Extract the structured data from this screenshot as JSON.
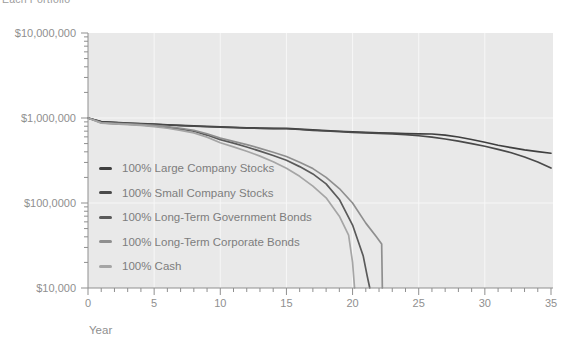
{
  "caption_top": "Each Portfolio",
  "colors": {
    "page_bg": "#ffffff",
    "plot_bg": "#e9e9e9",
    "grid": "#f7f7f7",
    "axis": "#8f8f8f",
    "tick_label": "#8f8f8f",
    "legend_text": "#7d7d7d"
  },
  "chart_data": {
    "type": "line",
    "title": "",
    "x_axis": {
      "label": "Year",
      "min": 0,
      "max": 35,
      "major_ticks": [
        0,
        5,
        10,
        15,
        20,
        25,
        30,
        35
      ],
      "minor_tick_interval": 1
    },
    "y_axis": {
      "scale": "log",
      "min": 10000,
      "max": 10000000,
      "ticks": [
        {
          "value": 10000000,
          "label": "$10,000,000"
        },
        {
          "value": 1000000,
          "label": "$1,000,000"
        },
        {
          "value": 100000,
          "label": "$100,0000"
        },
        {
          "value": 10000,
          "label": "$10,000"
        }
      ]
    },
    "grid": {
      "vertical_years": [
        5,
        10,
        15,
        20,
        25,
        30
      ],
      "horizontal_values": [
        1000000,
        100000
      ]
    },
    "legend_position": "inside-left",
    "series": [
      {
        "name": "100% Large Company Stocks",
        "color": "#3f3f3f",
        "points": [
          [
            0,
            1000000
          ],
          [
            1,
            905000
          ],
          [
            2,
            888000
          ],
          [
            3,
            872000
          ],
          [
            4,
            858000
          ],
          [
            5,
            848000
          ],
          [
            6,
            833000
          ],
          [
            7,
            820000
          ],
          [
            8,
            806000
          ],
          [
            9,
            795000
          ],
          [
            10,
            788000
          ],
          [
            11,
            778000
          ],
          [
            12,
            768000
          ],
          [
            13,
            762000
          ],
          [
            14,
            757000
          ],
          [
            15,
            753000
          ],
          [
            16,
            738000
          ],
          [
            17,
            723000
          ],
          [
            18,
            710000
          ],
          [
            19,
            698000
          ],
          [
            20,
            688000
          ],
          [
            21,
            678000
          ],
          [
            22,
            670000
          ],
          [
            23,
            663000
          ],
          [
            24,
            656000
          ],
          [
            25,
            650000
          ],
          [
            26,
            648000
          ],
          [
            27,
            628000
          ],
          [
            28,
            598000
          ],
          [
            29,
            558000
          ],
          [
            30,
            518000
          ],
          [
            31,
            478000
          ],
          [
            32,
            448000
          ],
          [
            33,
            422000
          ],
          [
            34,
            402000
          ],
          [
            35,
            385000
          ]
        ]
      },
      {
        "name": "100% Small Company Stocks",
        "color": "#4a4a4a",
        "points": [
          [
            0,
            1000000
          ],
          [
            1,
            900000
          ],
          [
            2,
            882000
          ],
          [
            3,
            866000
          ],
          [
            4,
            852000
          ],
          [
            5,
            842000
          ],
          [
            6,
            827000
          ],
          [
            7,
            814000
          ],
          [
            8,
            800000
          ],
          [
            9,
            789000
          ],
          [
            10,
            782000
          ],
          [
            11,
            772000
          ],
          [
            12,
            762000
          ],
          [
            13,
            756000
          ],
          [
            14,
            751000
          ],
          [
            15,
            747000
          ],
          [
            16,
            732000
          ],
          [
            17,
            717000
          ],
          [
            18,
            703000
          ],
          [
            19,
            690000
          ],
          [
            20,
            679000
          ],
          [
            21,
            668000
          ],
          [
            22,
            658000
          ],
          [
            23,
            648000
          ],
          [
            24,
            636000
          ],
          [
            25,
            618000
          ],
          [
            26,
            595000
          ],
          [
            27,
            566000
          ],
          [
            28,
            535000
          ],
          [
            29,
            500000
          ],
          [
            30,
            465000
          ],
          [
            31,
            428000
          ],
          [
            32,
            390000
          ],
          [
            33,
            348000
          ],
          [
            34,
            303000
          ],
          [
            35,
            258000
          ]
        ]
      },
      {
        "name": "100% Long-Term Government Bonds",
        "color": "#5a5a5a",
        "points": [
          [
            0,
            1000000
          ],
          [
            1,
            878000
          ],
          [
            2,
            860000
          ],
          [
            3,
            845000
          ],
          [
            4,
            828000
          ],
          [
            5,
            806000
          ],
          [
            6,
            776000
          ],
          [
            7,
            740000
          ],
          [
            8,
            698000
          ],
          [
            9,
            630000
          ],
          [
            10,
            556000
          ],
          [
            11,
            506000
          ],
          [
            12,
            456000
          ],
          [
            13,
            408000
          ],
          [
            14,
            362000
          ],
          [
            15,
            318000
          ],
          [
            16,
            268000
          ],
          [
            17,
            220000
          ],
          [
            18,
            168000
          ],
          [
            19,
            110000
          ],
          [
            20,
            55000
          ],
          [
            20.8,
            24000
          ],
          [
            21.1,
            14000
          ],
          [
            21.3,
            10000
          ]
        ]
      },
      {
        "name": "100% Long-Term Corporate Bonds",
        "color": "#8f8f8f",
        "points": [
          [
            0,
            1000000
          ],
          [
            1,
            884000
          ],
          [
            2,
            867000
          ],
          [
            3,
            853000
          ],
          [
            4,
            838000
          ],
          [
            5,
            818000
          ],
          [
            6,
            790000
          ],
          [
            7,
            757000
          ],
          [
            8,
            718000
          ],
          [
            9,
            652000
          ],
          [
            10,
            580000
          ],
          [
            11,
            532000
          ],
          [
            12,
            486000
          ],
          [
            13,
            440000
          ],
          [
            14,
            396000
          ],
          [
            15,
            352000
          ],
          [
            16,
            302000
          ],
          [
            17,
            254000
          ],
          [
            18,
            200000
          ],
          [
            19,
            148000
          ],
          [
            20,
            100000
          ],
          [
            21,
            58000
          ],
          [
            21.8,
            40000
          ],
          [
            22.2,
            33000
          ],
          [
            22.25,
            10000
          ]
        ]
      },
      {
        "name": "100% Cash",
        "color": "#a5a5a5",
        "points": [
          [
            0,
            1000000
          ],
          [
            1,
            870000
          ],
          [
            2,
            852000
          ],
          [
            3,
            836000
          ],
          [
            4,
            818000
          ],
          [
            5,
            792000
          ],
          [
            6,
            758000
          ],
          [
            7,
            716000
          ],
          [
            8,
            668000
          ],
          [
            9,
            596000
          ],
          [
            10,
            512000
          ],
          [
            11,
            458000
          ],
          [
            12,
            406000
          ],
          [
            13,
            356000
          ],
          [
            14,
            306000
          ],
          [
            15,
            256000
          ],
          [
            16,
            206000
          ],
          [
            17,
            158000
          ],
          [
            18,
            115000
          ],
          [
            19,
            70000
          ],
          [
            19.7,
            42000
          ],
          [
            20,
            20000
          ],
          [
            20.15,
            10000
          ]
        ]
      }
    ]
  }
}
